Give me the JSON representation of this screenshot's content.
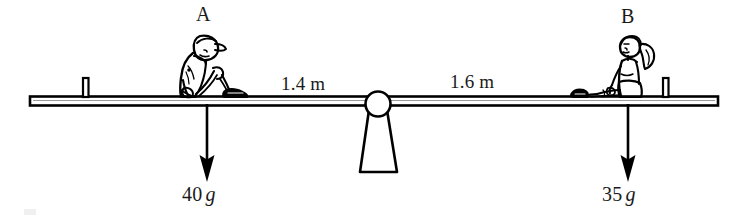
{
  "diagram": {
    "type": "physics-free-body-diagram",
    "colors": {
      "ink": "#000000",
      "text": "#1a1a1a",
      "background": "#ffffff",
      "plank_fill": "#ffffff"
    },
    "points": [
      {
        "id": "A",
        "label": "A",
        "side": "left"
      },
      {
        "id": "B",
        "label": "B",
        "side": "right"
      }
    ],
    "distances": [
      {
        "id": "left-span",
        "label": "1.4 m",
        "value": 1.4,
        "unit": "m",
        "from": "A",
        "to": "pivot"
      },
      {
        "id": "right-span",
        "label": "1.6 m",
        "value": 1.6,
        "unit": "m",
        "from": "pivot",
        "to": "B"
      }
    ],
    "forces": [
      {
        "id": "weight-A",
        "magnitude": "40",
        "unit": "g",
        "label": "40 g",
        "direction": "down",
        "applied_at": "A"
      },
      {
        "id": "weight-B",
        "magnitude": "35",
        "unit": "g",
        "label": "35 g",
        "direction": "down",
        "applied_at": "B"
      }
    ],
    "figures": [
      {
        "id": "child-A",
        "description": "boy-sitting-knees-up-with-cap",
        "at": "A"
      },
      {
        "id": "child-B",
        "description": "girl-sitting-legs-forward-with-ponytail",
        "at": "B"
      }
    ],
    "pivot": {
      "id": "fulcrum",
      "shape": "circle-on-trapezoid-stand"
    },
    "plank": {
      "id": "seesaw-plank",
      "shape": "horizontal-bar",
      "end_pegs": 2
    }
  }
}
